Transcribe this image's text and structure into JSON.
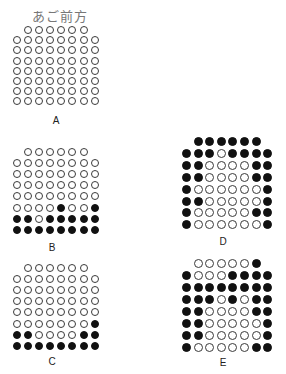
{
  "title": "あご前方",
  "colors": {
    "filled": "#111111",
    "open_border": "#3a3a3a",
    "background": "#ffffff"
  },
  "grids": [
    {
      "id": "A",
      "label": "A",
      "rows": [
        "000000",
        "00000000",
        "00000000",
        "00000000",
        "00000000",
        "00000000",
        "00000000",
        "00000000"
      ]
    },
    {
      "id": "B",
      "label": "B",
      "rows": [
        "000000",
        "00000000",
        "00000000",
        "00000000",
        "00000000",
        "00001001",
        "11011111",
        "11111111"
      ]
    },
    {
      "id": "C",
      "label": "C",
      "rows": [
        "000000",
        "00000000",
        "00000000",
        "00000000",
        "00000000",
        "00000001",
        "11000011",
        "11111111"
      ]
    },
    {
      "id": "D",
      "label": "D",
      "rows": [
        "111111",
        "11101111",
        "11000011",
        "11000011",
        "10000001",
        "11000001",
        "10000011",
        "10000001"
      ]
    },
    {
      "id": "E",
      "label": "E",
      "rows": [
        "000001",
        "10001111",
        "11111111",
        "11101011",
        "11000011",
        "11000001",
        "11000001",
        "10000011"
      ]
    }
  ]
}
